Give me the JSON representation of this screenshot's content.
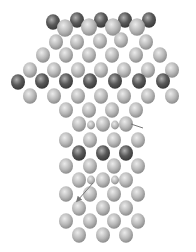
{
  "figure": {
    "colors": {
      "light_atom": "#b8b8b8",
      "light_highlight": "#ebebeb",
      "dark_atom": "#5a5a5a",
      "dark_highlight": "#b0b0b0",
      "bond_line": "#888888",
      "background": "#ffffff"
    }
  },
  "atoms": [
    {
      "x": 53,
      "y": 22,
      "r": 7,
      "t": "dark"
    },
    {
      "x": 77,
      "y": 20,
      "r": 7,
      "t": "dark"
    },
    {
      "x": 101,
      "y": 20,
      "r": 7,
      "t": "dark"
    },
    {
      "x": 125,
      "y": 20,
      "r": 7,
      "t": "dark"
    },
    {
      "x": 149,
      "y": 20,
      "r": 7,
      "t": "dark"
    },
    {
      "x": 65,
      "y": 28,
      "r": 8,
      "t": "light"
    },
    {
      "x": 89,
      "y": 27,
      "r": 8,
      "t": "light"
    },
    {
      "x": 113,
      "y": 27,
      "r": 8,
      "t": "light"
    },
    {
      "x": 137,
      "y": 27,
      "r": 8,
      "t": "light"
    },
    {
      "x": 56,
      "y": 42,
      "r": 7,
      "t": "light"
    },
    {
      "x": 77,
      "y": 42,
      "r": 7,
      "t": "light"
    },
    {
      "x": 100,
      "y": 41,
      "r": 7,
      "t": "light"
    },
    {
      "x": 121,
      "y": 40,
      "r": 7,
      "t": "light"
    },
    {
      "x": 146,
      "y": 42,
      "r": 7,
      "t": "light"
    },
    {
      "x": 43,
      "y": 55,
      "r": 7,
      "t": "light"
    },
    {
      "x": 66,
      "y": 55,
      "r": 7,
      "t": "light"
    },
    {
      "x": 89,
      "y": 55,
      "r": 7,
      "t": "light"
    },
    {
      "x": 112,
      "y": 55,
      "r": 7,
      "t": "light"
    },
    {
      "x": 136,
      "y": 55,
      "r": 7,
      "t": "light"
    },
    {
      "x": 160,
      "y": 55,
      "r": 7,
      "t": "light"
    },
    {
      "x": 30,
      "y": 70,
      "r": 7,
      "t": "light"
    },
    {
      "x": 54,
      "y": 70,
      "r": 7,
      "t": "light"
    },
    {
      "x": 78,
      "y": 70,
      "r": 7,
      "t": "light"
    },
    {
      "x": 101,
      "y": 70,
      "r": 7,
      "t": "light"
    },
    {
      "x": 124,
      "y": 70,
      "r": 7,
      "t": "light"
    },
    {
      "x": 148,
      "y": 70,
      "r": 7,
      "t": "light"
    },
    {
      "x": 172,
      "y": 70,
      "r": 7,
      "t": "light"
    },
    {
      "x": 18,
      "y": 82,
      "r": 7,
      "t": "dark"
    },
    {
      "x": 42,
      "y": 81,
      "r": 7,
      "t": "dark"
    },
    {
      "x": 66,
      "y": 81,
      "r": 7,
      "t": "dark"
    },
    {
      "x": 90,
      "y": 81,
      "r": 7,
      "t": "dark"
    },
    {
      "x": 115,
      "y": 81,
      "r": 7,
      "t": "dark"
    },
    {
      "x": 139,
      "y": 81,
      "r": 7,
      "t": "dark"
    },
    {
      "x": 163,
      "y": 81,
      "r": 7,
      "t": "dark"
    },
    {
      "x": 30,
      "y": 96,
      "r": 7,
      "t": "light"
    },
    {
      "x": 54,
      "y": 96,
      "r": 7,
      "t": "light"
    },
    {
      "x": 78,
      "y": 96,
      "r": 7,
      "t": "light"
    },
    {
      "x": 101,
      "y": 96,
      "r": 7,
      "t": "light"
    },
    {
      "x": 124,
      "y": 96,
      "r": 7,
      "t": "light"
    },
    {
      "x": 148,
      "y": 96,
      "r": 7,
      "t": "light"
    },
    {
      "x": 172,
      "y": 96,
      "r": 7,
      "t": "light"
    },
    {
      "x": 66,
      "y": 110,
      "r": 7,
      "t": "light"
    },
    {
      "x": 89,
      "y": 110,
      "r": 7,
      "t": "light"
    },
    {
      "x": 112,
      "y": 110,
      "r": 7,
      "t": "light"
    },
    {
      "x": 136,
      "y": 110,
      "r": 7,
      "t": "light"
    },
    {
      "x": 79,
      "y": 124,
      "r": 7,
      "t": "light"
    },
    {
      "x": 91,
      "y": 125,
      "r": 4,
      "t": "light"
    },
    {
      "x": 103,
      "y": 124,
      "r": 7,
      "t": "light"
    },
    {
      "x": 115,
      "y": 125,
      "r": 4,
      "t": "light"
    },
    {
      "x": 126,
      "y": 124,
      "r": 7,
      "t": "light"
    },
    {
      "x": 66,
      "y": 140,
      "r": 7,
      "t": "light"
    },
    {
      "x": 90,
      "y": 140,
      "r": 7,
      "t": "light"
    },
    {
      "x": 114,
      "y": 140,
      "r": 7,
      "t": "light"
    },
    {
      "x": 138,
      "y": 140,
      "r": 7,
      "t": "light"
    },
    {
      "x": 79,
      "y": 153,
      "r": 7,
      "t": "dark"
    },
    {
      "x": 103,
      "y": 153,
      "r": 7,
      "t": "dark"
    },
    {
      "x": 126,
      "y": 153,
      "r": 7,
      "t": "dark"
    },
    {
      "x": 66,
      "y": 166,
      "r": 7,
      "t": "light"
    },
    {
      "x": 90,
      "y": 166,
      "r": 7,
      "t": "light"
    },
    {
      "x": 114,
      "y": 166,
      "r": 7,
      "t": "light"
    },
    {
      "x": 138,
      "y": 166,
      "r": 7,
      "t": "light"
    },
    {
      "x": 79,
      "y": 180,
      "r": 7,
      "t": "light"
    },
    {
      "x": 91,
      "y": 180,
      "r": 4,
      "t": "light"
    },
    {
      "x": 103,
      "y": 180,
      "r": 7,
      "t": "light"
    },
    {
      "x": 115,
      "y": 180,
      "r": 4,
      "t": "light"
    },
    {
      "x": 126,
      "y": 180,
      "r": 7,
      "t": "light"
    },
    {
      "x": 66,
      "y": 194,
      "r": 7,
      "t": "light"
    },
    {
      "x": 90,
      "y": 194,
      "r": 7,
      "t": "light"
    },
    {
      "x": 114,
      "y": 194,
      "r": 7,
      "t": "light"
    },
    {
      "x": 138,
      "y": 194,
      "r": 7,
      "t": "light"
    },
    {
      "x": 79,
      "y": 208,
      "r": 7,
      "t": "light"
    },
    {
      "x": 103,
      "y": 208,
      "r": 7,
      "t": "light"
    },
    {
      "x": 126,
      "y": 208,
      "r": 7,
      "t": "light"
    },
    {
      "x": 66,
      "y": 221,
      "r": 7,
      "t": "light"
    },
    {
      "x": 90,
      "y": 221,
      "r": 7,
      "t": "light"
    },
    {
      "x": 114,
      "y": 221,
      "r": 7,
      "t": "light"
    },
    {
      "x": 138,
      "y": 221,
      "r": 7,
      "t": "light"
    },
    {
      "x": 79,
      "y": 235,
      "r": 7,
      "t": "light"
    },
    {
      "x": 103,
      "y": 235,
      "r": 7,
      "t": "light"
    },
    {
      "x": 126,
      "y": 235,
      "r": 7,
      "t": "light"
    }
  ],
  "arrows": [
    {
      "x1": 93,
      "y1": 183,
      "x2": 78,
      "y2": 200,
      "head": true
    },
    {
      "x1": 131,
      "y1": 124,
      "x2": 143,
      "y2": 128,
      "head": false
    }
  ]
}
